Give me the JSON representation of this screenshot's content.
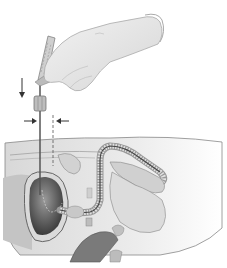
{
  "figure": {
    "labels": [],
    "colors": {
      "background": "#ffffff",
      "glove": "#e6e6e6",
      "glove_shadow": "#c8c8c8",
      "tissue_light": "#ebebeb",
      "tissue_mid": "#c9c9c9",
      "bladder_dark": "#555555",
      "outline": "#777777"
    }
  }
}
